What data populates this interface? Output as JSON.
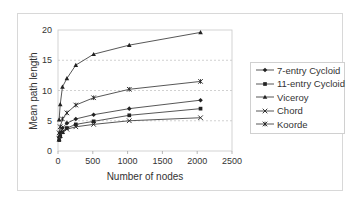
{
  "chart_data": {
    "type": "line",
    "title": "",
    "xlabel": "Number of nodes",
    "ylabel": "Mean path length",
    "xlim": [
      0,
      2500
    ],
    "ylim": [
      0,
      20
    ],
    "xticks": [
      "0",
      "500",
      "1000",
      "1500",
      "2000",
      "2500"
    ],
    "yticks": [
      "0",
      "5",
      "10",
      "15",
      "20"
    ],
    "grid": {
      "horizontal": true,
      "style": "dashed"
    },
    "legend_position": "right",
    "x": [
      16,
      32,
      64,
      128,
      256,
      512,
      1024,
      2048
    ],
    "series": [
      {
        "name": "7-entry Cycloid",
        "marker": "diamond",
        "values": [
          2.3,
          3.0,
          3.8,
          4.6,
          5.3,
          6.0,
          7.0,
          8.4
        ]
      },
      {
        "name": "11-entry Cycloid",
        "marker": "square",
        "values": [
          1.8,
          2.4,
          3.1,
          3.8,
          4.4,
          4.9,
          5.9,
          7.0
        ]
      },
      {
        "name": "Viceroy",
        "marker": "triangle",
        "values": [
          5.2,
          7.7,
          10.6,
          12.0,
          14.2,
          16.0,
          17.5,
          19.6
        ]
      },
      {
        "name": "Chord",
        "marker": "x",
        "values": [
          2.0,
          2.6,
          3.2,
          3.6,
          4.0,
          4.4,
          5.0,
          5.5
        ]
      },
      {
        "name": "Koorde",
        "marker": "star",
        "values": [
          3.0,
          4.0,
          5.3,
          6.3,
          7.6,
          8.8,
          10.2,
          11.5
        ]
      }
    ]
  },
  "axes": {
    "xlabel": "Number of nodes",
    "ylabel": "Mean path length"
  },
  "legend": [
    {
      "label": "7-entry Cycloid"
    },
    {
      "label": "11-entry Cycloid"
    },
    {
      "label": "Viceroy"
    },
    {
      "label": "Chord"
    },
    {
      "label": "Koorde"
    }
  ]
}
